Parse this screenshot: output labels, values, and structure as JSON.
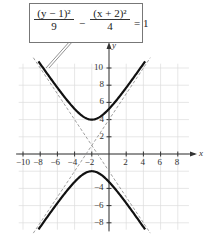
{
  "equation": {
    "term1_num": "(y − 1)²",
    "term1_den": "9",
    "minus": "−",
    "term2_num": "(x + 2)²",
    "term2_den": "4",
    "equals": "= 1"
  },
  "axes": {
    "x_label": "x",
    "y_label": "y",
    "x_ticks": [
      "−10",
      "−8",
      "−6",
      "−4",
      "−2",
      "2",
      "4",
      "6",
      "8"
    ],
    "y_ticks": [
      "10",
      "8",
      "6",
      "4",
      "2",
      "−4",
      "−6",
      "−8"
    ]
  },
  "chart_data": {
    "type": "line",
    "xlabel": "x",
    "ylabel": "y",
    "xlim": [
      -10,
      9
    ],
    "ylim": [
      -9,
      11
    ],
    "grid": true,
    "x_tick_labels": [
      -10,
      -8,
      -6,
      -4,
      -2,
      2,
      4,
      6,
      8
    ],
    "y_tick_labels": [
      -8,
      -6,
      -4,
      2,
      4,
      6,
      8,
      10
    ],
    "series": [
      {
        "name": "upper branch",
        "style": "solid",
        "description": "y = 1 + 3*sqrt(1 + (x+2)^2/4), vertex (-2, 4)"
      },
      {
        "name": "lower branch",
        "style": "solid",
        "description": "y = 1 - 3*sqrt(1 + (x+2)^2/4), vertex (-2, -2)"
      },
      {
        "name": "asymptote 1",
        "style": "dashed",
        "description": "y - 1 = 1.5(x + 2)"
      },
      {
        "name": "asymptote 2",
        "style": "dashed",
        "description": "y - 1 = -1.5(x + 2)"
      }
    ],
    "center": [
      -2,
      1
    ],
    "vertices": [
      [
        -2,
        4
      ],
      [
        -2,
        -2
      ]
    ]
  }
}
